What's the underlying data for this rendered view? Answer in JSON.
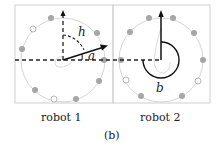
{
  "panels": [
    {
      "label": "robot 1",
      "angles": [
        "h",
        "a"
      ]
    },
    {
      "label": "robot 2",
      "angles": [
        "b"
      ]
    }
  ],
  "caption": "(b)",
  "colors": {
    "frame": "#cfcfcf",
    "circle": "#c8c8c8",
    "dot": "#a6a6a6",
    "arrow": "#111111",
    "dash": "#222222"
  }
}
